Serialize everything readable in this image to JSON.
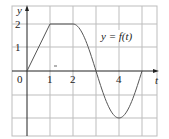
{
  "chart_data": {
    "type": "line",
    "title": "",
    "xlabel": "t",
    "ylabel": "y",
    "xlim": [
      -0.65,
      5.65
    ],
    "ylim": [
      -2.75,
      2.75
    ],
    "grid": true,
    "x_ticks": [
      0,
      1,
      2,
      4
    ],
    "y_ticks": [
      1,
      2
    ],
    "x_tick_labels": [
      "0",
      "1",
      "2",
      "4"
    ],
    "y_tick_labels": [
      "1",
      "2"
    ],
    "annotation": "y = f(t)",
    "series": [
      {
        "name": "y = f(t)",
        "segments": [
          {
            "kind": "linear",
            "x": [
              0,
              1
            ],
            "y": [
              0,
              2
            ]
          },
          {
            "kind": "constant",
            "x": [
              1,
              2
            ],
            "y": [
              2,
              2
            ]
          },
          {
            "kind": "cosine",
            "x": [
              2,
              3,
              4,
              5
            ],
            "y": [
              2,
              0,
              -2,
              0
            ]
          }
        ]
      }
    ],
    "colors": {
      "grid": "#b8b8b8",
      "axis": "#222222",
      "curve": "#555555"
    }
  },
  "labels": {
    "y_axis": "y",
    "t_axis": "t",
    "origin": "0",
    "x1": "1",
    "x2": "2",
    "x4": "4",
    "y1": "1",
    "y2": "2",
    "curve_label": "y = f(t)"
  }
}
